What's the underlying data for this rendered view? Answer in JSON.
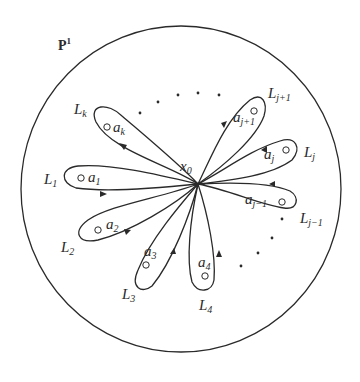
{
  "figure": {
    "top_caption": "",
    "space_label": {
      "base": "P",
      "sup": "1"
    },
    "base_point": {
      "base": "x",
      "sub": "0"
    },
    "colors": {
      "stroke": "#2a2a2a",
      "background": "#ffffff"
    },
    "loops": [
      {
        "id": "L_k",
        "loop_label": {
          "base": "L",
          "sub": "k"
        },
        "point_label": {
          "base": "a",
          "sub": "k"
        }
      },
      {
        "id": "L_1",
        "loop_label": {
          "base": "L",
          "sub": "1"
        },
        "point_label": {
          "base": "a",
          "sub": "1"
        }
      },
      {
        "id": "L_2",
        "loop_label": {
          "base": "L",
          "sub": "2"
        },
        "point_label": {
          "base": "a",
          "sub": "2"
        }
      },
      {
        "id": "L_3",
        "loop_label": {
          "base": "L",
          "sub": "3"
        },
        "point_label": {
          "base": "a",
          "sub": "3"
        }
      },
      {
        "id": "L_4",
        "loop_label": {
          "base": "L",
          "sub": "4"
        },
        "point_label": {
          "base": "a",
          "sub": "4"
        }
      },
      {
        "id": "L_j-1",
        "loop_label": {
          "base": "L",
          "sub": "j−1"
        },
        "point_label": {
          "base": "a",
          "sub": "j−1"
        }
      },
      {
        "id": "L_j",
        "loop_label": {
          "base": "L",
          "sub": "j"
        },
        "point_label": {
          "base": "a",
          "sub": "j"
        }
      },
      {
        "id": "L_j+1",
        "loop_label": {
          "base": "L",
          "sub": "j+1"
        },
        "point_label": {
          "base": "a",
          "sub": "j+1"
        }
      }
    ],
    "ellipsis_dots": [
      "upper-arc",
      "lower-right-arc"
    ]
  }
}
